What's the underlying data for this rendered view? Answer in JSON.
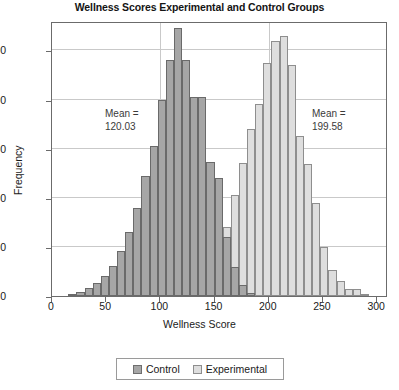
{
  "chart_data": {
    "type": "bar",
    "title": "Wellness Scores Experimental and Control Groups",
    "xlabel": "Wellness Score",
    "ylabel": "Frequency",
    "xlim": [
      0,
      310
    ],
    "ylim": [
      0,
      560
    ],
    "xticks": [
      0,
      50,
      100,
      150,
      200,
      250,
      300
    ],
    "yticks": [
      0,
      100,
      200,
      300,
      400,
      500
    ],
    "grid": true,
    "legend_position": "bottom",
    "bin_width": 7.5,
    "series": [
      {
        "name": "Control",
        "color": "#a6a6a6",
        "mean_label": "Mean =",
        "mean_value": "120.03",
        "bins": [
          15,
          22.5,
          30,
          37.5,
          45,
          52.5,
          60,
          67.5,
          75,
          82.5,
          90,
          97.5,
          105,
          112.5,
          120,
          127.5,
          135,
          142.5,
          150,
          157.5,
          165,
          172.5,
          180
        ],
        "values": [
          4,
          8,
          16,
          26,
          40,
          62,
          92,
          130,
          180,
          245,
          305,
          400,
          480,
          545,
          480,
          405,
          405,
          272,
          240,
          120,
          60,
          22,
          6
        ]
      },
      {
        "name": "Experimental",
        "color": "#dedede",
        "mean_label": "Mean =",
        "mean_value": "199.58",
        "bins": [
          112.5,
          120,
          127.5,
          135,
          142.5,
          150,
          157.5,
          165,
          172.5,
          180,
          187.5,
          195,
          202.5,
          210,
          217.5,
          225,
          232.5,
          240,
          247.5,
          255,
          262.5,
          270,
          277.5,
          285
        ],
        "values": [
          3,
          6,
          8,
          30,
          62,
          115,
          140,
          205,
          270,
          340,
          390,
          475,
          520,
          530,
          470,
          325,
          268,
          190,
          100,
          52,
          30,
          14,
          14,
          4
        ]
      }
    ]
  },
  "legend": {
    "items": [
      {
        "label": "Control"
      },
      {
        "label": "Experimental"
      }
    ]
  }
}
